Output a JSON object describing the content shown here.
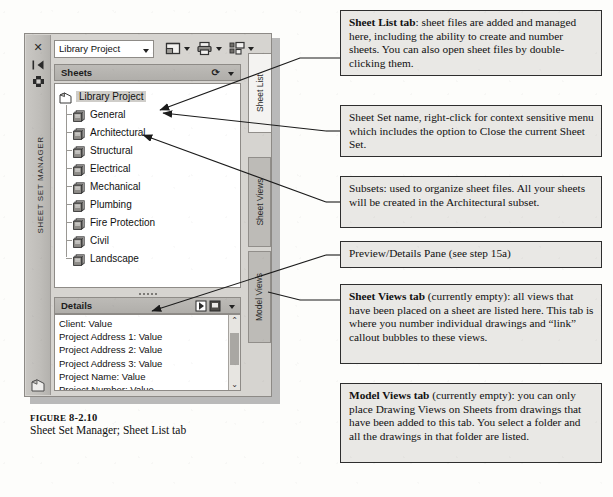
{
  "palette": {
    "vertical_title": "SHEET SET MANAGER",
    "rail_buttons": [
      {
        "name": "close-icon",
        "glyph": "✕"
      },
      {
        "name": "auto-hide-icon",
        "glyph": "⇤"
      },
      {
        "name": "properties-icon",
        "glyph": "✾"
      }
    ],
    "toolbar": {
      "sheet_set_value": "Library Project",
      "buttons": [
        {
          "name": "new-sheet-icon",
          "label": "New Sheet"
        },
        {
          "name": "publish-icon",
          "label": "Publish"
        },
        {
          "name": "sheet-set-properties-icon",
          "label": "Sheet Set Properties"
        }
      ]
    },
    "sheets_section": {
      "title": "Sheets",
      "refresh_glyph": "⟳"
    },
    "tree": {
      "root": "Library Project",
      "subsets": [
        "General",
        "Architectural",
        "Structural",
        "Electrical",
        "Mechanical",
        "Plumbing",
        "Fire Protection",
        "Civil",
        "Landscape"
      ]
    },
    "details_section": {
      "title": "Details",
      "rows": [
        "Client: Value",
        "Project Address 1: Value",
        "Project Address 2: Value",
        "Project Address 3: Value",
        "Project Name: Value",
        "Project Number: Value"
      ],
      "scroll_up_glyph": "⌃",
      "scroll_down_glyph": "⌄"
    },
    "tabs": [
      {
        "label": "Sheet List",
        "active": true
      },
      {
        "label": "Sheet Views",
        "active": false
      },
      {
        "label": "Model Views",
        "active": false
      }
    ]
  },
  "figure": {
    "label_word": "Figure",
    "label_number": "8-2.10",
    "caption": "Sheet Set Manager; Sheet List tab"
  },
  "callouts": [
    {
      "lead": "Sheet List tab",
      "text": ": sheet files are added and managed here, including the ability to create and number sheets. You can also open sheet files by double-clicking them."
    },
    {
      "lead": "",
      "text": "Sheet Set name, right-click for context sensitive menu which includes the option to Close the current Sheet Set."
    },
    {
      "lead": "",
      "text": "Subsets: used to organize sheet files. All your sheets will be created in the Architectural subset."
    },
    {
      "lead": "",
      "text": "Preview/Details Pane (see step 15a)"
    },
    {
      "lead": "Sheet Views tab",
      "text": " (currently empty): all views that have been placed on a sheet are listed here. This tab is where you number individual drawings and “link” callout bubbles to these views."
    },
    {
      "lead": "Model Views tab",
      "text": " (currently empty): you can only place Drawing Views on Sheets from drawings that have been added to this tab. You select a folder and all the drawings in that folder are listed."
    }
  ],
  "colors": {
    "page_background": "#fdfdfb",
    "palette_frame": "#d6d4d0",
    "header_band": "#bdbbb7",
    "callout_fill": "#e9e8e5",
    "callout_border": "#2e2e2e",
    "selection_highlight": "#cfcdc9"
  }
}
